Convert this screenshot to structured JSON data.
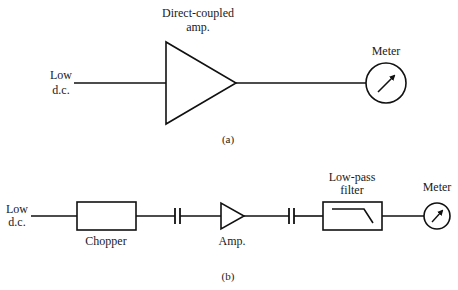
{
  "diagram_a": {
    "caption": "(a)",
    "input_label": {
      "line1": "Low",
      "line2": "d.c."
    },
    "amplifier_label": {
      "line1": "Direct-coupled",
      "line2": "amp."
    },
    "meter_label": "Meter",
    "components": [
      "input",
      "direct-coupled-amplifier",
      "meter"
    ]
  },
  "diagram_b": {
    "caption": "(b)",
    "input_label": {
      "line1": "Low",
      "line2": "d.c."
    },
    "chopper_label": "Chopper",
    "amplifier_label": "Amp.",
    "filter_label": {
      "line1": "Low-pass",
      "line2": "filter"
    },
    "meter_label": "Meter",
    "components": [
      "input",
      "chopper",
      "capacitor",
      "amplifier",
      "capacitor",
      "low-pass-filter",
      "meter"
    ]
  },
  "icons": {
    "amplifier": "triangle-amplifier-icon",
    "meter": "circle-needle-meter-icon",
    "capacitor": "parallel-plates-capacitor-icon",
    "filter": "lowpass-response-curve-icon"
  },
  "colors": {
    "stroke": "#111111",
    "background": "#ffffff",
    "text": "#1a1a1a"
  }
}
